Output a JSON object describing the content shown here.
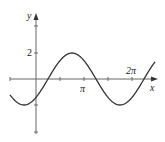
{
  "chart_data": {
    "type": "line",
    "title": "",
    "function": "y = 2 sin(x - π/4)",
    "xlabel": "x",
    "ylabel": "y",
    "x_tick_labels": [
      {
        "value": 3.14159,
        "label": "π"
      },
      {
        "value": 6.28319,
        "label": "2π"
      }
    ],
    "y_tick_labels": [
      {
        "value": 2,
        "label": "2"
      }
    ],
    "x_ticks": [
      1.5708,
      3.14159,
      4.7124,
      6.28319
    ],
    "y_ticks": [
      4,
      2,
      -2,
      -4
    ],
    "xlim": [
      -1.7,
      7.8
    ],
    "ylim": [
      -4,
      5
    ],
    "grid": false,
    "series": [
      {
        "name": "y = 2 sin(x - π/4)",
        "amplitude": 2,
        "phase_shift": 0.7854,
        "period": 6.28319,
        "x": [
          -1.7,
          -0.785,
          0,
          0.785,
          2.356,
          3.927,
          5.498,
          7.069,
          7.5
        ],
        "y": [
          -1.96,
          -2,
          -1.41,
          0,
          2,
          0,
          -2,
          0,
          1.2
        ]
      }
    ]
  },
  "labels": {
    "y_axis": "y",
    "x_axis": "x",
    "y_tick_2": "2",
    "x_tick_pi": "π",
    "x_tick_2pi": "2π"
  },
  "colors": {
    "axis": "#555555",
    "curve": "#333333"
  }
}
